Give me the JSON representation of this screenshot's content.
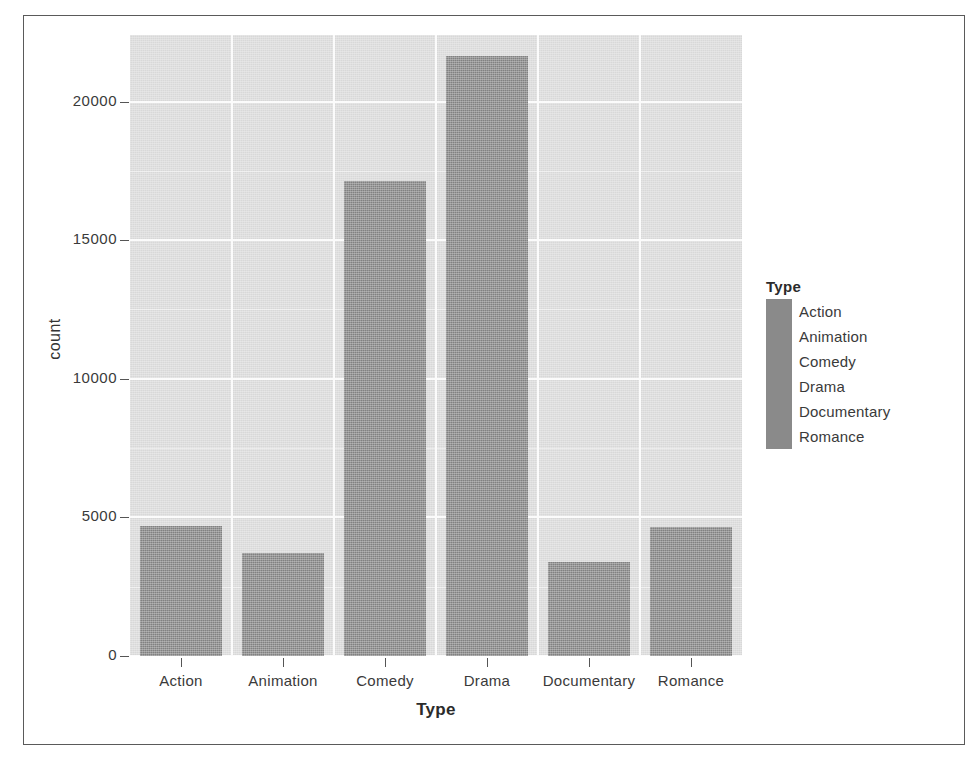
{
  "chart_data": {
    "type": "bar",
    "title": "",
    "xlabel": "Type",
    "ylabel": "count",
    "categories": [
      "Action",
      "Animation",
      "Comedy",
      "Drama",
      "Documentary",
      "Romance"
    ],
    "values": [
      4700,
      3700,
      17150,
      21650,
      3400,
      4650
    ],
    "ylim": [
      0,
      22400
    ],
    "yticks": [
      0,
      5000,
      10000,
      15000,
      20000
    ],
    "ytick_labels": [
      "0",
      "5000",
      "10000",
      "15000",
      "20000"
    ],
    "grid": true,
    "legend": {
      "title": "Type",
      "position": "right",
      "entries": [
        {
          "label": "Action",
          "color": "#8a8a8a"
        },
        {
          "label": "Animation",
          "color": "#8a8a8a"
        },
        {
          "label": "Comedy",
          "color": "#8a8a8a"
        },
        {
          "label": "Drama",
          "color": "#8a8a8a"
        },
        {
          "label": "Documentary",
          "color": "#8a8a8a"
        },
        {
          "label": "Romance",
          "color": "#8a8a8a"
        }
      ]
    },
    "style": {
      "panel_background": "#d8d8d8",
      "gridline_color": "#fbfbfb",
      "bar_color": "#818181",
      "text_color": "#3a3a3a",
      "frame_color": "#5a5a5a"
    }
  },
  "axes": {
    "y_title": "count",
    "x_title": "Type"
  }
}
